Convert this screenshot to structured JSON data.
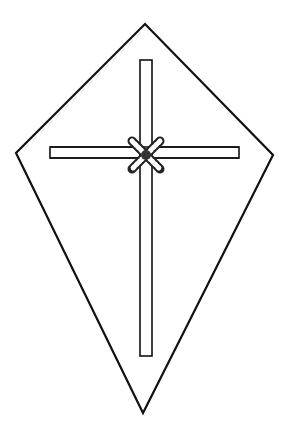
{
  "diagram": {
    "colors": {
      "background": "#ffffff",
      "stroke": "#111111",
      "knot_fill": "#555555"
    },
    "kite_outline": {
      "top": [
        145,
        24
      ],
      "right": [
        273,
        155
      ],
      "bottom": [
        143,
        413
      ],
      "left": [
        16,
        153
      ]
    },
    "vertical_stick": {
      "x": 140,
      "y": 60,
      "width": 12,
      "height": 296
    },
    "horizontal_stick": {
      "x": 50,
      "y": 147,
      "width": 189,
      "height": 11
    },
    "knot": {
      "cx": 146,
      "cy": 155
    }
  }
}
